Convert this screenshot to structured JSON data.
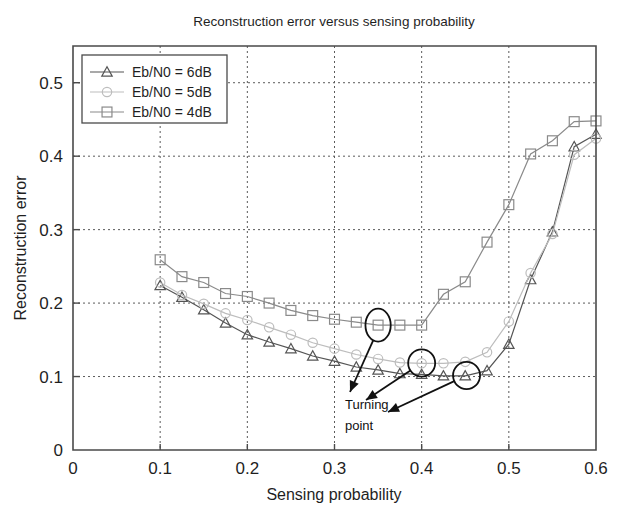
{
  "chart_data": {
    "type": "line",
    "title": "Reconstruction error versus sensing probability",
    "xlabel": "Sensing probability",
    "ylabel": "Reconstruction error",
    "xlim": [
      0,
      0.6
    ],
    "ylim": [
      0,
      0.55
    ],
    "xticks": [
      "0",
      "0.1",
      "0.2",
      "0.3",
      "0.4",
      "0.5",
      "0.6"
    ],
    "xtick_values": [
      0,
      0.1,
      0.2,
      0.3,
      0.4,
      0.5,
      0.6
    ],
    "yticks": [
      "0",
      "0.1",
      "0.2",
      "0.3",
      "0.4",
      "0.5"
    ],
    "ytick_values": [
      0,
      0.1,
      0.2,
      0.3,
      0.4,
      0.5
    ],
    "grid": true,
    "grid_style": "dotted",
    "legend_position": "top-left",
    "series": [
      {
        "name": "Eb/N0 = 6dB",
        "marker": "triangle",
        "color": "#555555",
        "x": [
          0.1,
          0.125,
          0.15,
          0.175,
          0.2,
          0.225,
          0.25,
          0.275,
          0.3,
          0.325,
          0.35,
          0.375,
          0.4,
          0.425,
          0.45,
          0.475,
          0.5,
          0.525,
          0.55,
          0.575,
          0.6
        ],
        "values": [
          0.224,
          0.208,
          0.191,
          0.173,
          0.157,
          0.147,
          0.138,
          0.128,
          0.121,
          0.113,
          0.109,
          0.104,
          0.103,
          0.101,
          0.101,
          0.108,
          0.144,
          0.232,
          0.297,
          0.413,
          0.43
        ]
      },
      {
        "name": "Eb/N0 = 5dB",
        "marker": "circle",
        "color": "#bdbdbd",
        "x": [
          0.1,
          0.125,
          0.15,
          0.175,
          0.2,
          0.225,
          0.25,
          0.275,
          0.3,
          0.325,
          0.35,
          0.375,
          0.4,
          0.425,
          0.45,
          0.475,
          0.5,
          0.525,
          0.55,
          0.575,
          0.6
        ],
        "values": [
          0.228,
          0.211,
          0.199,
          0.186,
          0.177,
          0.167,
          0.157,
          0.146,
          0.138,
          0.13,
          0.124,
          0.119,
          0.118,
          0.118,
          0.12,
          0.133,
          0.175,
          0.241,
          0.294,
          0.402,
          0.424
        ]
      },
      {
        "name": "Eb/N0 = 4dB",
        "marker": "square",
        "color": "#8a8a8a",
        "x": [
          0.1,
          0.125,
          0.15,
          0.175,
          0.2,
          0.225,
          0.25,
          0.275,
          0.3,
          0.325,
          0.35,
          0.375,
          0.4,
          0.425,
          0.45,
          0.475,
          0.5,
          0.525,
          0.55,
          0.575,
          0.6
        ],
        "values": [
          0.259,
          0.236,
          0.228,
          0.213,
          0.209,
          0.2,
          0.19,
          0.183,
          0.178,
          0.174,
          0.17,
          0.17,
          0.17,
          0.212,
          0.229,
          0.283,
          0.334,
          0.403,
          0.421,
          0.447,
          0.448
        ]
      }
    ],
    "annotations": [
      {
        "label": "turning-point-4dB",
        "shape": "ellipse",
        "x": 0.35,
        "y": 0.17,
        "rx": 0.0145,
        "ry": 0.0225
      },
      {
        "label": "turning-point-5dB",
        "shape": "circle",
        "x": 0.4,
        "y": 0.1185,
        "rx": 0.0155,
        "ry": 0.0185
      },
      {
        "label": "turning-point-6dB",
        "shape": "circle",
        "x": 0.4515,
        "y": 0.1015,
        "rx": 0.0155,
        "ry": 0.0185
      }
    ],
    "annotation_text": {
      "line1": "Turning",
      "line2": "point"
    }
  }
}
